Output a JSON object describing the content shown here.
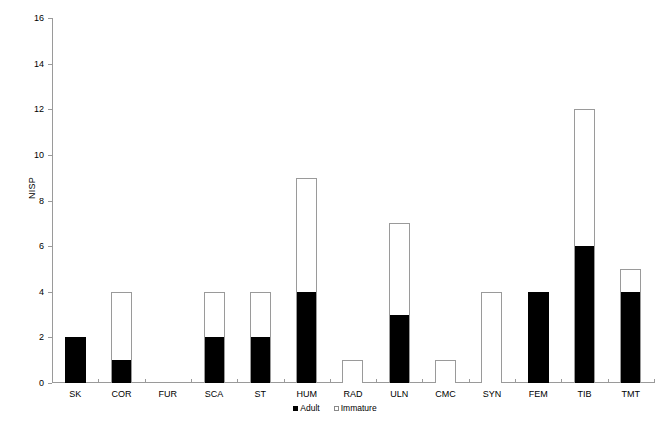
{
  "chart_data": {
    "type": "bar",
    "subtype": "stacked-bar",
    "title": "",
    "xlabel": "",
    "ylabel": "NISP",
    "ylim": [
      0,
      16
    ],
    "ytick_step": 2,
    "yticks": [
      0,
      2,
      4,
      6,
      8,
      10,
      12,
      14,
      16
    ],
    "grid": false,
    "legend_position": "bottom-center",
    "categories": [
      "SK",
      "COR",
      "FUR",
      "SCA",
      "ST",
      "HUM",
      "RAD",
      "ULN",
      "CMC",
      "SYN",
      "FEM",
      "TIB",
      "TMT"
    ],
    "series": [
      {
        "name": "Adult",
        "color": "#000000",
        "values": [
          2,
          1,
          0,
          2,
          2,
          4,
          0,
          3,
          0,
          0,
          4,
          6,
          4
        ]
      },
      {
        "name": "Immature",
        "color": "#ffffff",
        "values": [
          0,
          3,
          0,
          2,
          2,
          5,
          1,
          4,
          1,
          4,
          0,
          6,
          1
        ]
      }
    ],
    "totals": [
      2,
      4,
      0,
      4,
      4,
      9,
      1,
      7,
      1,
      4,
      4,
      12,
      5
    ]
  },
  "legend": {
    "items": [
      {
        "label": "Adult",
        "swatch": "filled-square-icon"
      },
      {
        "label": "Immature",
        "swatch": "open-square-icon"
      }
    ]
  },
  "colors": {
    "adult": "#000000",
    "immature": "#ffffff",
    "outline": "#9a9a9a",
    "axis": "#9a9a9a",
    "background": "#ffffff",
    "text": "#000000"
  }
}
